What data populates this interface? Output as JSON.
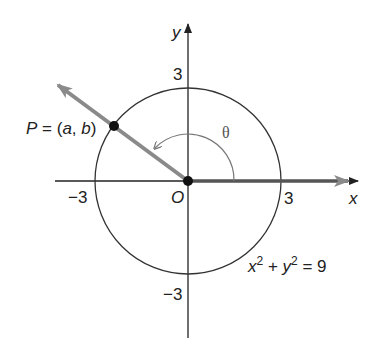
{
  "diagram": {
    "axes": {
      "x_label": "x",
      "y_label": "y"
    },
    "ticks": {
      "x_pos": "3",
      "x_neg": "−3",
      "y_pos": "3",
      "y_neg": "−3"
    },
    "origin_label": "O",
    "point_label": "P = (a, b)",
    "angle_label": "θ",
    "equation": {
      "x": "x",
      "x_exp": "2",
      "plus": " + ",
      "y": "y",
      "y_exp": "2",
      "rhs": " = 9"
    },
    "colors": {
      "axis": "#222222",
      "ray": "#8a8a8a",
      "circle": "#333333",
      "arc": "#777777"
    }
  }
}
